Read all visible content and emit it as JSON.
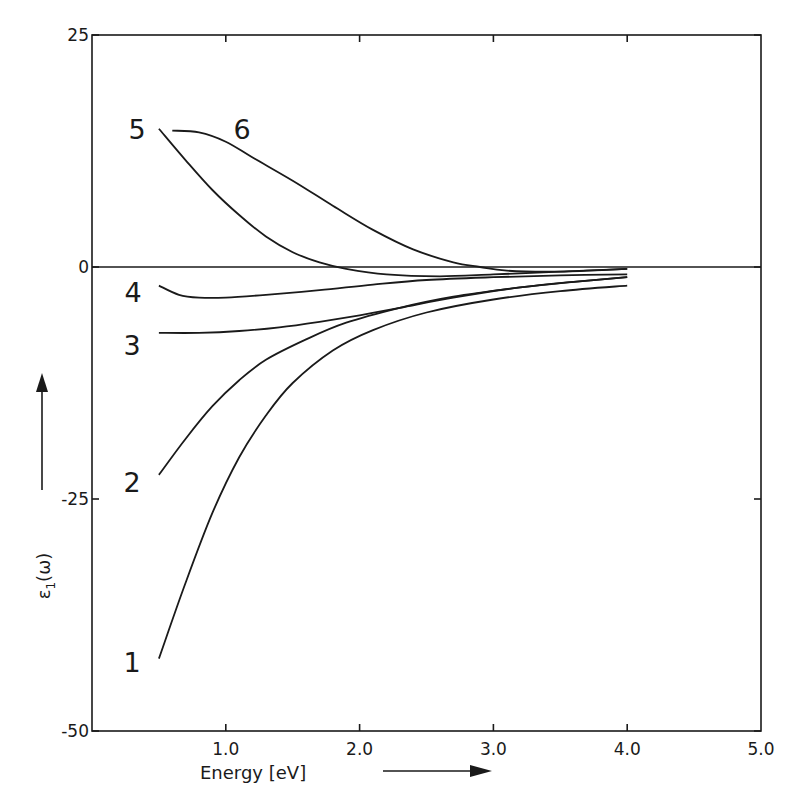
{
  "chart_data": {
    "type": "line",
    "title": "",
    "xlabel": "Energy [eV]",
    "ylabel": "ε₁(ω)",
    "xlim": [
      0,
      5.0
    ],
    "ylim": [
      -50,
      25
    ],
    "grid": false,
    "legend": "none (curves labeled inline 1–6)",
    "x_ticks": [
      "1.0",
      "2.0",
      "3.0",
      "4.0",
      "5.0"
    ],
    "x_tick_values": [
      1,
      2,
      3,
      4,
      5
    ],
    "y_ticks": [
      "25",
      "0",
      "-25",
      "-50"
    ],
    "y_tick_values": [
      25,
      0,
      -25,
      -50
    ],
    "series": [
      {
        "name": "1",
        "x": [
          0.5,
          0.7,
          0.9,
          1.1,
          1.3,
          1.5,
          1.8,
          2.1,
          2.5,
          3.0,
          3.5,
          4.0
        ],
        "y": [
          -42.2,
          -34.0,
          -26.5,
          -20.5,
          -16.0,
          -12.5,
          -9.0,
          -6.8,
          -4.9,
          -3.5,
          -2.6,
          -2.0
        ]
      },
      {
        "name": "2",
        "x": [
          0.5,
          0.7,
          0.9,
          1.1,
          1.3,
          1.6,
          1.9,
          2.3,
          2.7,
          3.2,
          3.6,
          4.0
        ],
        "y": [
          -22.4,
          -18.5,
          -15.0,
          -12.2,
          -10.0,
          -7.8,
          -6.0,
          -4.4,
          -3.2,
          -2.2,
          -1.6,
          -1.1
        ]
      },
      {
        "name": "3",
        "x": [
          0.5,
          0.8,
          1.1,
          1.4,
          1.7,
          2.0,
          2.3,
          2.7,
          3.2,
          3.6,
          4.0
        ],
        "y": [
          -7.1,
          -7.1,
          -6.9,
          -6.5,
          -5.9,
          -5.2,
          -4.4,
          -3.3,
          -2.2,
          -1.6,
          -1.1
        ]
      },
      {
        "name": "4",
        "x": [
          0.5,
          0.65,
          0.8,
          1.0,
          1.3,
          1.7,
          2.1,
          2.5,
          3.0,
          3.5,
          4.0
        ],
        "y": [
          -2.0,
          -3.0,
          -3.3,
          -3.3,
          -3.0,
          -2.5,
          -1.9,
          -1.4,
          -1.1,
          -0.9,
          -0.8
        ]
      },
      {
        "name": "5",
        "x": [
          0.5,
          0.7,
          0.9,
          1.1,
          1.3,
          1.5,
          1.7,
          1.9,
          2.2,
          2.6,
          3.0,
          3.5,
          4.0
        ],
        "y": [
          14.9,
          11.5,
          8.3,
          5.6,
          3.3,
          1.6,
          0.5,
          -0.2,
          -0.8,
          -1.0,
          -0.8,
          -0.5,
          -0.2
        ]
      },
      {
        "name": "6",
        "x": [
          0.6,
          0.8,
          1.0,
          1.2,
          1.5,
          1.8,
          2.1,
          2.4,
          2.7,
          2.9,
          3.1,
          3.5,
          4.0
        ],
        "y": [
          14.7,
          14.5,
          13.5,
          11.8,
          9.3,
          6.6,
          4.0,
          1.9,
          0.5,
          0.0,
          -0.4,
          -0.5,
          -0.2
        ]
      }
    ]
  },
  "axes": {
    "x_title": "Energy [eV]",
    "y_title_main": "ε",
    "y_title_sub": "1",
    "y_title_arg": "(ω)"
  }
}
